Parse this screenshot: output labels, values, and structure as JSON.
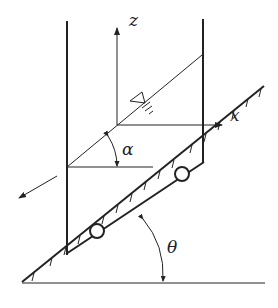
{
  "diagram": {
    "labels": {
      "z_axis": "z",
      "x_axis": "x",
      "alpha": "α",
      "theta": "θ"
    },
    "free_surface_symbol": "▽",
    "colors": {
      "stroke": "#222222",
      "background": "#ffffff"
    },
    "elements": {
      "container": {
        "left_wall_x": 67,
        "right_wall_x": 203
      },
      "wheels": [
        {
          "cx": 97,
          "cy": 231,
          "r": 7
        },
        {
          "cx": 182,
          "cy": 174,
          "r": 7
        }
      ],
      "incline_angle_label": "θ",
      "surface_tilt_label": "α",
      "motion_arrow": "down-slope"
    }
  }
}
